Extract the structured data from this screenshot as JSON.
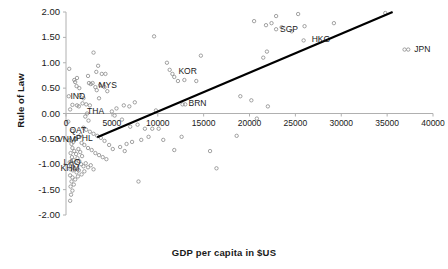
{
  "chart_data": {
    "type": "scatter",
    "title": "",
    "xlabel": "GDP per capita in $US",
    "ylabel": "Rule of Law",
    "xlim": [
      0,
      40000
    ],
    "ylim": [
      -2.0,
      2.0
    ],
    "xticks": [
      0,
      5000,
      10000,
      15000,
      20000,
      25000,
      30000,
      35000,
      40000
    ],
    "xtick_labels": [
      "0",
      "5000",
      "10000",
      "15000",
      "20000",
      "25000",
      "30000",
      "35000",
      "40000"
    ],
    "yticks": [
      -2.0,
      -1.5,
      -1.0,
      -0.5,
      0.0,
      0.5,
      1.0,
      1.5,
      2.0
    ],
    "ytick_labels": [
      "-2.00",
      "-1.50",
      "-1.00",
      "-0.50",
      "0.00",
      "0.50",
      "1.00",
      "1.50",
      "2.00"
    ],
    "grid": false,
    "legend": "none",
    "marker": "open-circle",
    "marker_color": "#8a8a8a",
    "line_color": "#000000",
    "axis_color": "#b0b0b0",
    "trendline": {
      "label": "linear-trendline",
      "x0": 3400,
      "y0": -0.47,
      "x1": 35600,
      "y1": 2.0
    },
    "annotations": [
      {
        "text": "IND",
        "x": 700,
        "y": 0.17,
        "dx": -4,
        "dy": -10
      },
      {
        "text": "THA",
        "x": 2300,
        "y": 0.0,
        "dx": -2,
        "dy": -4
      },
      {
        "text": "MYS",
        "x": 4200,
        "y": 0.52,
        "dx": -8,
        "dy": -3
      },
      {
        "text": "KOR",
        "x": 11600,
        "y": 0.78,
        "dx": 4,
        "dy": -4
      },
      {
        "text": "BRN",
        "x": 12700,
        "y": 0.18,
        "dx": 4,
        "dy": -2
      },
      {
        "text": "SGP",
        "x": 22900,
        "y": 1.66,
        "dx": 2,
        "dy": -1
      },
      {
        "text": "HKG",
        "x": 25900,
        "y": 1.44,
        "dx": 6,
        "dy": -2
      },
      {
        "text": "JPN",
        "x": 37300,
        "y": 1.26,
        "dx": 4,
        "dy": -2
      },
      {
        "text": "QAT",
        "x": 700,
        "y": -0.34,
        "dx": -5,
        "dy": -2
      },
      {
        "text": "VNM",
        "x": 350,
        "y": -0.53,
        "dx": -14,
        "dy": -2
      },
      {
        "text": "PHL",
        "x": 1100,
        "y": -0.5,
        "dx": -2,
        "dy": -2
      },
      {
        "text": "LAO",
        "x": 600,
        "y": -0.98,
        "dx": -10,
        "dy": -2
      },
      {
        "text": "KHM",
        "x": 500,
        "y": -1.1,
        "dx": -12,
        "dy": -2
      }
    ],
    "points": [
      {
        "x": 350,
        "y": 0.88
      },
      {
        "x": 900,
        "y": 0.66
      },
      {
        "x": 1000,
        "y": 0.62
      },
      {
        "x": 1150,
        "y": 0.54
      },
      {
        "x": 1200,
        "y": 0.7
      },
      {
        "x": 1450,
        "y": 0.5
      },
      {
        "x": 1500,
        "y": 0.36
      },
      {
        "x": 2400,
        "y": 0.74
      },
      {
        "x": 2500,
        "y": 0.6
      },
      {
        "x": 3000,
        "y": 1.2
      },
      {
        "x": 3300,
        "y": 0.82
      },
      {
        "x": 3500,
        "y": 0.94
      },
      {
        "x": 3700,
        "y": 0.56
      },
      {
        "x": 3900,
        "y": 0.78
      },
      {
        "x": 4300,
        "y": 0.78
      },
      {
        "x": 4500,
        "y": 0.44
      },
      {
        "x": 3200,
        "y": 0.52
      },
      {
        "x": 3350,
        "y": 0.46
      },
      {
        "x": 3600,
        "y": 0.3
      },
      {
        "x": 2700,
        "y": 0.58
      },
      {
        "x": 2900,
        "y": 0.6
      },
      {
        "x": 2200,
        "y": 0.18
      },
      {
        "x": 2600,
        "y": 0.16
      },
      {
        "x": 1800,
        "y": 0.2
      },
      {
        "x": 1200,
        "y": 0.16
      },
      {
        "x": 1400,
        "y": 0.14
      },
      {
        "x": 9600,
        "y": 1.52
      },
      {
        "x": 11000,
        "y": 1.0
      },
      {
        "x": 11300,
        "y": 0.86
      },
      {
        "x": 11800,
        "y": 0.72
      },
      {
        "x": 12200,
        "y": 0.64
      },
      {
        "x": 12900,
        "y": 0.66
      },
      {
        "x": 14700,
        "y": 1.14
      },
      {
        "x": 14200,
        "y": 0.64
      },
      {
        "x": 9800,
        "y": 0.06
      },
      {
        "x": 13000,
        "y": 0.18
      },
      {
        "x": 20500,
        "y": 1.82
      },
      {
        "x": 21800,
        "y": 1.74
      },
      {
        "x": 22400,
        "y": 1.78
      },
      {
        "x": 23500,
        "y": 1.7
      },
      {
        "x": 24600,
        "y": 1.62
      },
      {
        "x": 22900,
        "y": 1.92
      },
      {
        "x": 25300,
        "y": 1.96
      },
      {
        "x": 26000,
        "y": 1.72
      },
      {
        "x": 21900,
        "y": 1.22
      },
      {
        "x": 21500,
        "y": 1.1
      },
      {
        "x": 29200,
        "y": 1.78
      },
      {
        "x": 34800,
        "y": 1.98
      },
      {
        "x": 36900,
        "y": 1.26
      },
      {
        "x": 19000,
        "y": 0.34
      },
      {
        "x": 20200,
        "y": 0.26
      },
      {
        "x": 22000,
        "y": 0.14
      },
      {
        "x": 20800,
        "y": -0.1
      },
      {
        "x": 18600,
        "y": -0.44
      },
      {
        "x": 6300,
        "y": 0.16
      },
      {
        "x": 6900,
        "y": 0.14
      },
      {
        "x": 7500,
        "y": 0.22
      },
      {
        "x": 5500,
        "y": 0.1
      },
      {
        "x": 5000,
        "y": 0.04
      },
      {
        "x": 5300,
        "y": -0.04
      },
      {
        "x": 6100,
        "y": -0.12
      },
      {
        "x": 7000,
        "y": -0.26
      },
      {
        "x": 7800,
        "y": -0.22
      },
      {
        "x": 8600,
        "y": -0.3
      },
      {
        "x": 9400,
        "y": -0.3
      },
      {
        "x": 10100,
        "y": -0.3
      },
      {
        "x": 8200,
        "y": -0.52
      },
      {
        "x": 9000,
        "y": -0.46
      },
      {
        "x": 10600,
        "y": -0.52
      },
      {
        "x": 12600,
        "y": -0.46
      },
      {
        "x": 11800,
        "y": -0.72
      },
      {
        "x": 6600,
        "y": -0.6
      },
      {
        "x": 7200,
        "y": -0.56
      },
      {
        "x": 5900,
        "y": -0.66
      },
      {
        "x": 6400,
        "y": -0.74
      },
      {
        "x": 5100,
        "y": -0.7
      },
      {
        "x": 4700,
        "y": -0.62
      },
      {
        "x": 4200,
        "y": -0.54
      },
      {
        "x": 3800,
        "y": -0.48
      },
      {
        "x": 3400,
        "y": -0.44
      },
      {
        "x": 3000,
        "y": -0.4
      },
      {
        "x": 2600,
        "y": -0.36
      },
      {
        "x": 2200,
        "y": -0.32
      },
      {
        "x": 1900,
        "y": -0.28
      },
      {
        "x": 1600,
        "y": -0.42
      },
      {
        "x": 1300,
        "y": -0.46
      },
      {
        "x": 1000,
        "y": -0.5
      },
      {
        "x": 800,
        "y": -0.56
      },
      {
        "x": 600,
        "y": -0.6
      },
      {
        "x": 1700,
        "y": -0.58
      },
      {
        "x": 2000,
        "y": -0.62
      },
      {
        "x": 2400,
        "y": -0.68
      },
      {
        "x": 2800,
        "y": -0.72
      },
      {
        "x": 3200,
        "y": -0.78
      },
      {
        "x": 3600,
        "y": -0.82
      },
      {
        "x": 4000,
        "y": -0.86
      },
      {
        "x": 4400,
        "y": -0.9
      },
      {
        "x": 700,
        "y": -0.68
      },
      {
        "x": 900,
        "y": -0.74
      },
      {
        "x": 1100,
        "y": -0.8
      },
      {
        "x": 1350,
        "y": -0.7
      },
      {
        "x": 1550,
        "y": -0.76
      },
      {
        "x": 1750,
        "y": -0.84
      },
      {
        "x": 500,
        "y": -0.78
      },
      {
        "x": 650,
        "y": -0.86
      },
      {
        "x": 850,
        "y": -0.92
      },
      {
        "x": 1050,
        "y": -0.96
      },
      {
        "x": 1250,
        "y": -0.88
      },
      {
        "x": 1450,
        "y": -0.94
      },
      {
        "x": 1650,
        "y": -1.0
      },
      {
        "x": 1900,
        "y": -1.04
      },
      {
        "x": 2150,
        "y": -0.98
      },
      {
        "x": 2400,
        "y": -1.06
      },
      {
        "x": 2700,
        "y": -1.02
      },
      {
        "x": 3000,
        "y": -1.1
      },
      {
        "x": 400,
        "y": -0.96
      },
      {
        "x": 550,
        "y": -1.04
      },
      {
        "x": 750,
        "y": -1.12
      },
      {
        "x": 950,
        "y": -1.08
      },
      {
        "x": 1150,
        "y": -1.16
      },
      {
        "x": 1400,
        "y": -1.12
      },
      {
        "x": 1700,
        "y": -1.2
      },
      {
        "x": 2000,
        "y": -1.14
      },
      {
        "x": 450,
        "y": -1.22
      },
      {
        "x": 700,
        "y": -1.26
      },
      {
        "x": 1000,
        "y": -1.3
      },
      {
        "x": 1300,
        "y": -1.24
      },
      {
        "x": 600,
        "y": -1.34
      },
      {
        "x": 850,
        "y": -1.4
      },
      {
        "x": 500,
        "y": -1.44
      },
      {
        "x": 700,
        "y": -1.52
      },
      {
        "x": 550,
        "y": -1.6
      },
      {
        "x": 450,
        "y": -1.72
      },
      {
        "x": 7900,
        "y": -1.34
      },
      {
        "x": 15700,
        "y": -0.74
      },
      {
        "x": 16400,
        "y": -1.08
      },
      {
        "x": 300,
        "y": 0.34
      },
      {
        "x": 450,
        "y": 0.08
      },
      {
        "x": 250,
        "y": -0.16
      },
      {
        "x": 1900,
        "y": 0.3
      },
      {
        "x": 2100,
        "y": -0.06
      },
      {
        "x": 2450,
        "y": -0.14
      }
    ]
  }
}
